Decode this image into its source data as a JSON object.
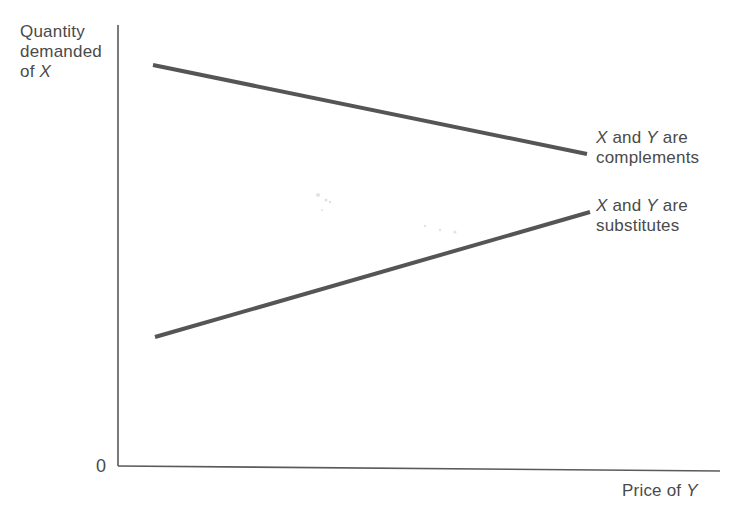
{
  "diagram": {
    "y_axis_label": {
      "line1": "Quantity",
      "line2": "demanded",
      "line3_prefix": "of ",
      "line3_var": "X"
    },
    "origin_label": "0",
    "x_axis_label": {
      "prefix": "Price of ",
      "var": "Y"
    },
    "annotations": [
      {
        "var1": "X",
        "mid": " and ",
        "var2": "Y",
        "suffix": " are",
        "line2": "complements"
      },
      {
        "var1": "X",
        "mid": " and ",
        "var2": "Y",
        "suffix": " are",
        "line2": "substitutes"
      }
    ],
    "lines": [
      {
        "name": "complements",
        "x1": 153,
        "y1": 65,
        "x2": 587,
        "y2": 154
      },
      {
        "name": "substitutes",
        "x1": 155,
        "y1": 337,
        "x2": 590,
        "y2": 212
      }
    ],
    "colors": {
      "axis": "#5a5a5a",
      "curve": "#555555",
      "text": "#4a4a4a"
    }
  }
}
